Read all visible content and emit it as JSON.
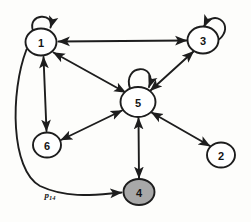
{
  "diagram": {
    "background_color": "#fdfdfb",
    "stroke_color": "#1d1d1d",
    "node_fill_default": "#ffffff",
    "node_fill_highlight": "#a8a8a8",
    "nodes": [
      {
        "id": "n1",
        "label": "1",
        "cx": 41,
        "cy": 42,
        "rx": 15.5,
        "ry": 13.5,
        "fill": "#ffffff",
        "highlighted": false,
        "self_loop": true,
        "self_loop_dir": "up"
      },
      {
        "id": "n3",
        "label": "3",
        "cx": 203,
        "cy": 40,
        "rx": 15.5,
        "ry": 13.5,
        "fill": "#ffffff",
        "highlighted": false,
        "self_loop": true,
        "self_loop_dir": "up-right"
      },
      {
        "id": "n5",
        "label": "5",
        "cx": 138,
        "cy": 102,
        "rx": 17.5,
        "ry": 15.0,
        "fill": "#ffffff",
        "highlighted": false,
        "self_loop": true,
        "self_loop_dir": "up"
      },
      {
        "id": "n6",
        "label": "6",
        "cx": 47,
        "cy": 145,
        "rx": 14.0,
        "ry": 12.5,
        "fill": "#ffffff",
        "highlighted": false,
        "self_loop": false,
        "self_loop_dir": ""
      },
      {
        "id": "n2",
        "label": "2",
        "cx": 221,
        "cy": 155,
        "rx": 14.0,
        "ry": 12.5,
        "fill": "#ffffff",
        "highlighted": false,
        "self_loop": false,
        "self_loop_dir": ""
      },
      {
        "id": "n4",
        "label": "4",
        "cx": 139,
        "cy": 192,
        "rx": 15.5,
        "ry": 13.0,
        "fill": "#a8a8a8",
        "highlighted": true,
        "self_loop": false,
        "self_loop_dir": ""
      }
    ],
    "edges": [
      {
        "from": "n1",
        "to": "n3",
        "direction": "both",
        "shape": "straight",
        "label": ""
      },
      {
        "from": "n1",
        "to": "n5",
        "direction": "both",
        "shape": "straight",
        "label": ""
      },
      {
        "from": "n1",
        "to": "n6",
        "direction": "both",
        "shape": "straight",
        "label": ""
      },
      {
        "from": "n3",
        "to": "n5",
        "direction": "both",
        "shape": "straight",
        "label": ""
      },
      {
        "from": "n5",
        "to": "n6",
        "direction": "both",
        "shape": "straight",
        "label": ""
      },
      {
        "from": "n5",
        "to": "n2",
        "direction": "both",
        "shape": "straight",
        "label": ""
      },
      {
        "from": "n5",
        "to": "n4",
        "direction": "both",
        "shape": "straight",
        "label": ""
      },
      {
        "from": "n1",
        "to": "n4",
        "direction": "forward",
        "shape": "curved",
        "label": "p14"
      }
    ],
    "edge_label": {
      "text_base": "p",
      "text_sub": "14",
      "x": 50,
      "y": 198
    }
  }
}
